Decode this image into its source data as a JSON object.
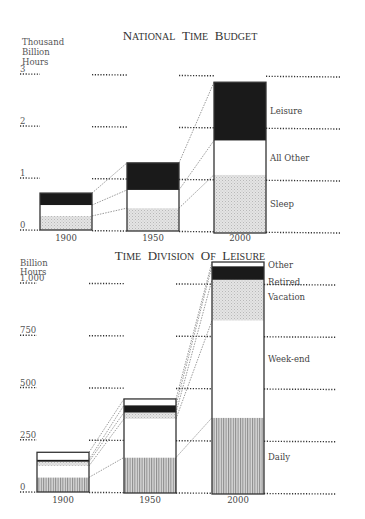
{
  "chart_data": [
    {
      "type": "bar",
      "stacked": true,
      "title": "National Time Budget",
      "ylabel": "Thousand Billion Hours",
      "ylabel_lines": [
        "Thousand",
        "Billion",
        "Hours"
      ],
      "xlabel": "",
      "categories": [
        "1900",
        "1950",
        "2000"
      ],
      "ylim": [
        0,
        3
      ],
      "yticks": [
        0,
        1,
        2,
        3
      ],
      "ytick_labels": [
        "0",
        "1",
        "2",
        "3"
      ],
      "grid": true,
      "series": [
        {
          "name": "Sleep",
          "pattern": "stipple",
          "values": [
            0.27,
            0.44,
            1.12
          ]
        },
        {
          "name": "All Other",
          "pattern": "white",
          "values": [
            0.21,
            0.35,
            0.66
          ]
        },
        {
          "name": "Leisure",
          "pattern": "black",
          "values": [
            0.23,
            0.52,
            1.12
          ]
        }
      ],
      "legend_position": "right-of-last-bar"
    },
    {
      "type": "bar",
      "stacked": true,
      "title": "Time Division of Leisure",
      "ylabel": "Billion Hours",
      "ylabel_lines": [
        "Billion",
        "Hours"
      ],
      "xlabel": "",
      "categories": [
        "1900",
        "1950",
        "2000"
      ],
      "ylim": [
        0,
        1000
      ],
      "yticks": [
        0,
        250,
        500,
        750,
        1000
      ],
      "ytick_labels": [
        "0",
        "250",
        "500",
        "750",
        "1,000"
      ],
      "grid": true,
      "series": [
        {
          "name": "Daily",
          "pattern": "vertical-lines",
          "values": [
            70,
            170,
            365
          ]
        },
        {
          "name": "Week-end",
          "pattern": "white",
          "values": [
            55,
            185,
            465
          ]
        },
        {
          "name": "Vacation",
          "pattern": "stipple",
          "values": [
            20,
            30,
            195
          ]
        },
        {
          "name": "Retired",
          "pattern": "black",
          "values": [
            10,
            35,
            65
          ]
        },
        {
          "name": "Other",
          "pattern": "white",
          "values": [
            35,
            30,
            20
          ]
        }
      ],
      "legend_position": "right-of-last-bar"
    }
  ]
}
